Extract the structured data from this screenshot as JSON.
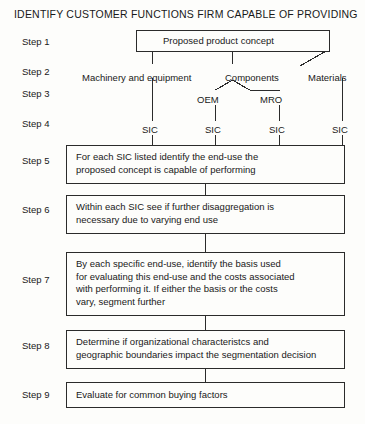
{
  "document": {
    "title": "IDENTIFY CUSTOMER FUNCTIONS FIRM CAPABLE OF PROVIDING",
    "type": "flowchart",
    "orientation": "top-to-bottom"
  },
  "steps": [
    {
      "id": "step-1",
      "label": "Step 1",
      "top": 36
    },
    {
      "id": "step-2",
      "label": "Step 2",
      "top": 66
    },
    {
      "id": "step-3",
      "label": "Step 3",
      "top": 88
    },
    {
      "id": "step-4",
      "label": "Step 4",
      "top": 118
    },
    {
      "id": "step-5",
      "label": "Step 5",
      "top": 155
    },
    {
      "id": "step-6",
      "label": "Step 6",
      "top": 204
    },
    {
      "id": "step-7",
      "label": "Step 7",
      "top": 274
    },
    {
      "id": "step-8",
      "label": "Step 8",
      "top": 340
    },
    {
      "id": "step-9",
      "label": "Step 9",
      "top": 389
    }
  ],
  "nodes": {
    "proposed_concept": {
      "text": "Proposed product concept",
      "x": 136,
      "y": 30,
      "w": 194,
      "h": 22
    },
    "step5_box": {
      "text": "For each SIC listed identify the end-use the\nproposed concept is capable of performing",
      "x": 66,
      "y": 145,
      "w": 279,
      "h": 39
    },
    "step6_box": {
      "text": "Within each SIC see if further disaggregation is\nnecessary due to varying end use",
      "x": 66,
      "y": 195,
      "w": 279,
      "h": 39
    },
    "step7_box": {
      "text": "By each specific end-use, identify the basis used\nfor evaluating this end-use and the costs associated\nwith performing it. If either the basis or the costs\nvary, segment further",
      "x": 66,
      "y": 252,
      "w": 279,
      "h": 64
    },
    "step8_box": {
      "text": "Determine if organizational characteristcs and\ngeographic boundaries impact the segmentation decision",
      "x": 66,
      "y": 330,
      "w": 279,
      "h": 39
    },
    "step9_box": {
      "text": "Evaluate for common buying factors",
      "x": 66,
      "y": 382,
      "w": 279,
      "h": 26
    }
  },
  "branches": {
    "level2": [
      {
        "id": "machinery",
        "label": "Machinery and equipment",
        "x": 82,
        "y": 72
      },
      {
        "id": "components",
        "label": "Components",
        "x": 225,
        "y": 72
      },
      {
        "id": "materials",
        "label": "Materials",
        "x": 308,
        "y": 72
      }
    ],
    "level3": [
      {
        "id": "oem",
        "label": "OEM",
        "x": 196,
        "y": 94
      },
      {
        "id": "mro",
        "label": "MRO",
        "x": 259,
        "y": 94
      }
    ],
    "level4": [
      {
        "id": "sic-1",
        "label": "SIC",
        "x": 141,
        "y": 124
      },
      {
        "id": "sic-2",
        "label": "SIC",
        "x": 204,
        "y": 124
      },
      {
        "id": "sic-3",
        "label": "SIC",
        "x": 268,
        "y": 124
      },
      {
        "id": "sic-4",
        "label": "SIC",
        "x": 331,
        "y": 124
      }
    ]
  },
  "colors": {
    "background": "#fdfdfb",
    "stroke": "#2b2b2b",
    "text": "#191919"
  }
}
